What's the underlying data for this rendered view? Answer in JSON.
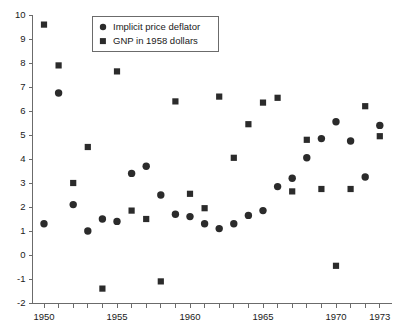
{
  "chart_data": {
    "type": "scatter",
    "title": "",
    "subtitle": "",
    "xlabel": "",
    "ylabel": "",
    "xlim": [
      1949.5,
      1973.8
    ],
    "ylim": [
      -2,
      10
    ],
    "grid": false,
    "legend_position": "top-center",
    "y_ticks": [
      10,
      9,
      8,
      7,
      6,
      5,
      4,
      3,
      2,
      1,
      0,
      -1,
      -2
    ],
    "y_tick_labels": [
      "10",
      "9",
      "8",
      "7",
      "6",
      "5",
      "4",
      "3",
      "2",
      "1",
      "0",
      "-1",
      "-2"
    ],
    "x_ticks": [
      1950,
      1951,
      1952,
      1953,
      1954,
      1955,
      1956,
      1957,
      1958,
      1959,
      1960,
      1961,
      1962,
      1963,
      1964,
      1965,
      1966,
      1967,
      1968,
      1969,
      1970,
      1971,
      1972,
      1973
    ],
    "x_tick_labels_shown": [
      {
        "x": 1950,
        "label": "1950"
      },
      {
        "x": 1955,
        "label": "1955"
      },
      {
        "x": 1960,
        "label": "1960"
      },
      {
        "x": 1965,
        "label": "1965"
      },
      {
        "x": 1970,
        "label": "1970"
      },
      {
        "x": 1973,
        "label": "1973"
      }
    ],
    "x": [
      1950,
      1951,
      1952,
      1953,
      1954,
      1955,
      1956,
      1957,
      1958,
      1959,
      1960,
      1961,
      1962,
      1963,
      1964,
      1965,
      1966,
      1967,
      1968,
      1969,
      1970,
      1971,
      1972,
      1973
    ],
    "series": [
      {
        "name": "Implicit price deflator",
        "marker": "circle",
        "color": "#2b2b2b",
        "values": [
          1.3,
          6.75,
          2.1,
          1.0,
          1.5,
          1.4,
          3.4,
          3.7,
          2.5,
          1.7,
          1.6,
          1.3,
          1.1,
          1.3,
          1.65,
          1.85,
          2.85,
          3.2,
          4.05,
          4.85,
          5.55,
          4.75,
          3.25,
          5.4
        ]
      },
      {
        "name": "GNP in 1958 dollars",
        "marker": "square",
        "color": "#2b2b2b",
        "values": [
          9.6,
          7.9,
          3.0,
          4.5,
          -1.4,
          7.65,
          1.85,
          1.5,
          -1.1,
          6.4,
          2.55,
          1.95,
          6.6,
          4.05,
          5.45,
          6.35,
          6.55,
          2.65,
          4.8,
          2.75,
          -0.45,
          2.75,
          6.2,
          4.95
        ]
      }
    ]
  },
  "legend": {
    "entries": [
      {
        "label": "Implicit price deflator",
        "marker": "circle"
      },
      {
        "label": "GNP in 1958 dollars",
        "marker": "square"
      }
    ]
  }
}
